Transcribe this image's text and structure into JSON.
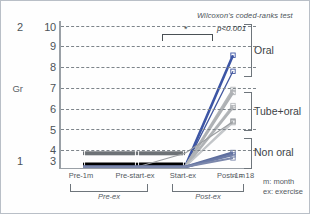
{
  "chart_data": {
    "type": "line",
    "title": "Wilcoxon's coded-ranks test",
    "xlabel": "",
    "ylabel": "Gr",
    "categories": [
      "Pre-1m",
      "Pre-start-ex",
      "Start-ex",
      "Post-1m"
    ],
    "x_positions": [
      0.0,
      0.42,
      0.62,
      1.0
    ],
    "ylim": [
      3,
      10
    ],
    "yticks": [
      "3",
      "4",
      "5",
      "6",
      "7",
      "8",
      "9",
      "10"
    ],
    "grid": true,
    "group_axis": {
      "label": "Gr",
      "top_label": "2",
      "bottom_label": "1"
    },
    "series": [
      {
        "name": "case-1",
        "color": "#3c55a5",
        "width": 2.6,
        "values": [
          3,
          3,
          3,
          8.55
        ]
      },
      {
        "name": "case-2",
        "color": "#43589f",
        "width": 1.3,
        "values": [
          3,
          3,
          3,
          7.75
        ]
      },
      {
        "name": "case-3",
        "color": "#b4b7ba",
        "width": 2.2,
        "values": [
          3,
          3,
          3,
          6.85
        ]
      },
      {
        "name": "case-4",
        "color": "#aeb1b4",
        "width": 2.6,
        "values": [
          3,
          3,
          3,
          6.7
        ]
      },
      {
        "name": "case-5",
        "color": "#b9bcbf",
        "width": 2.0,
        "values": [
          3,
          3,
          3,
          6.05
        ]
      },
      {
        "name": "case-6",
        "color": "#b0b3b6",
        "width": 2.4,
        "values": [
          3,
          3,
          3,
          5.95
        ]
      },
      {
        "name": "case-7",
        "color": "#c0c3c6",
        "width": 1.6,
        "values": [
          3,
          3,
          3,
          5.3
        ]
      },
      {
        "name": "case-8",
        "color": "#c4c7ca",
        "width": 1.4,
        "values": [
          3,
          3,
          3,
          5.2
        ]
      },
      {
        "name": "case-9",
        "color": "#9b9ea1",
        "width": 1.1,
        "values": [
          3,
          3,
          3.68,
          5.25
        ]
      },
      {
        "name": "case-10",
        "color": "#5e6e9e",
        "width": 2.8,
        "values": [
          3,
          3,
          3,
          3.72
        ]
      },
      {
        "name": "case-11",
        "color": "#6b7aa6",
        "width": 2.4,
        "values": [
          3,
          3,
          3,
          3.6
        ]
      },
      {
        "name": "case-12",
        "color": "#7c88ac",
        "width": 2.0,
        "values": [
          3,
          3,
          3,
          3.45
        ]
      }
    ],
    "bands": [
      {
        "name": "non-oral-band",
        "color": "#000000",
        "level": 3,
        "thickness": 9
      },
      {
        "name": "low-band",
        "color": "#6d7276",
        "level": 3.68,
        "thickness": 4
      }
    ],
    "significance": {
      "p_value": "p<0.001",
      "star": "*"
    },
    "right_groups": [
      {
        "label": "Oral",
        "from": 7.6,
        "to": 10.0,
        "center": 8.8
      },
      {
        "label": "Tube+oral",
        "from": 4.75,
        "to": 6.45,
        "center": 5.6
      },
      {
        "label": "Non oral",
        "from": 3.05,
        "to": 4.0,
        "center": 3.6
      }
    ],
    "bottom_groups": [
      {
        "label": "Pre-ex",
        "from": "Pre-1m",
        "to": "Pre-start-ex"
      },
      {
        "label": "Post-ex",
        "from": "Start-ex",
        "to": "Post-1m"
      }
    ],
    "sample_size": "n = 18",
    "abbreviations": [
      "m: month",
      "ex: exercise"
    ]
  }
}
